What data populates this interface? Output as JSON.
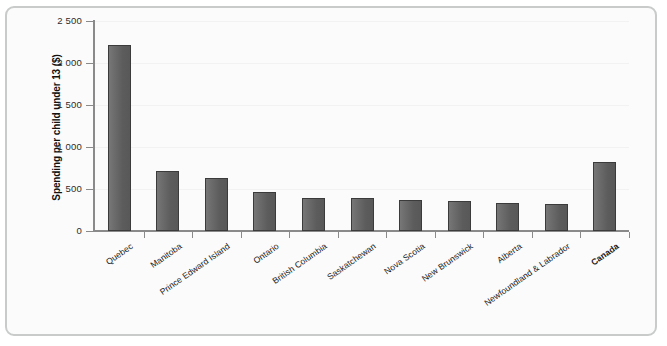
{
  "chart_data": {
    "type": "bar",
    "title": "",
    "subtitle": "",
    "xlabel": "",
    "ylabel": "Spending per child under 13 ($)",
    "ylim": [
      0,
      2500
    ],
    "ytick_labels": [
      "2 500",
      "2 000",
      "1 500",
      "1 000",
      "500",
      "0"
    ],
    "ytick_values": [
      2500,
      2000,
      1500,
      1000,
      500,
      0
    ],
    "grid": false,
    "legend": "none",
    "categories": [
      "Quebec",
      "Manitoba",
      "Prince Edward Island",
      "Ontario",
      "British Columbia",
      "Saskatchewan",
      "Nova Scotia",
      "New Brunswick",
      "Alberta",
      "Newfoundland & Labrador",
      "Canada"
    ],
    "values": [
      2220,
      710,
      630,
      460,
      390,
      395,
      365,
      355,
      335,
      325,
      825
    ],
    "highlight_category": "Canada",
    "bar_color": "#5c5c5c",
    "bar_edge_color": "#3b3b3b"
  },
  "axes": {
    "y_title": "Spending per child under 13 ($)",
    "y_ticks": [
      {
        "label": "2 500",
        "value": 2500
      },
      {
        "label": "2 000",
        "value": 2000
      },
      {
        "label": "1 500",
        "value": 1500
      },
      {
        "label": "1 000",
        "value": 1000
      },
      {
        "label": "500",
        "value": 500
      },
      {
        "label": "0",
        "value": 0
      }
    ]
  },
  "x_labels": [
    {
      "label": "Quebec",
      "bold": false
    },
    {
      "label": "Manitoba",
      "bold": false
    },
    {
      "label": "Prince Edward Island",
      "bold": false
    },
    {
      "label": "Ontario",
      "bold": false
    },
    {
      "label": "British Columbia",
      "bold": false
    },
    {
      "label": "Saskatchewan",
      "bold": false
    },
    {
      "label": "Nova Scotia",
      "bold": false
    },
    {
      "label": "New Brunswick",
      "bold": false
    },
    {
      "label": "Alberta",
      "bold": false
    },
    {
      "label": "Newfoundland & Labrador",
      "bold": false
    },
    {
      "label": "Canada",
      "bold": true
    }
  ],
  "colors": {
    "bar_fill": "#5c5c5c",
    "bar_edge": "#3b3b3b",
    "axis": "#8a8a8a",
    "frame": "#c9cbcb",
    "background": "#fbfbfb",
    "text": "#1a1a1a"
  }
}
